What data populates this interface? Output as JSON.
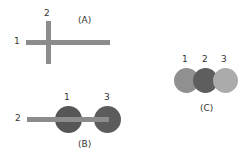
{
  "panels": {
    "A": {
      "caption": "(A)",
      "labels": {
        "horizontal": "1",
        "vertical": "2"
      },
      "description": "Two crossing bars: horizontal bar 1 and vertical bar 2"
    },
    "B": {
      "caption": "(B)",
      "labels": {
        "bar": "2",
        "circle_left": "1",
        "circle_right": "3"
      },
      "description": "Horizontal bar 2 overlaid on two dark circles 1 and 3"
    },
    "C": {
      "caption": "(C)",
      "labels": {
        "left": "1",
        "middle": "2",
        "right": "3"
      },
      "description": "Three overlapping circles: 1 medium gray, 2 dark gray, 3 light gray"
    }
  },
  "colors": {
    "bar": "#8c8c8c",
    "dark_circle": "#5a5a5a",
    "circle1_c": "#909090",
    "circle2_c": "#5e5e5e",
    "circle3_c": "#ababab",
    "text": "#333333"
  }
}
